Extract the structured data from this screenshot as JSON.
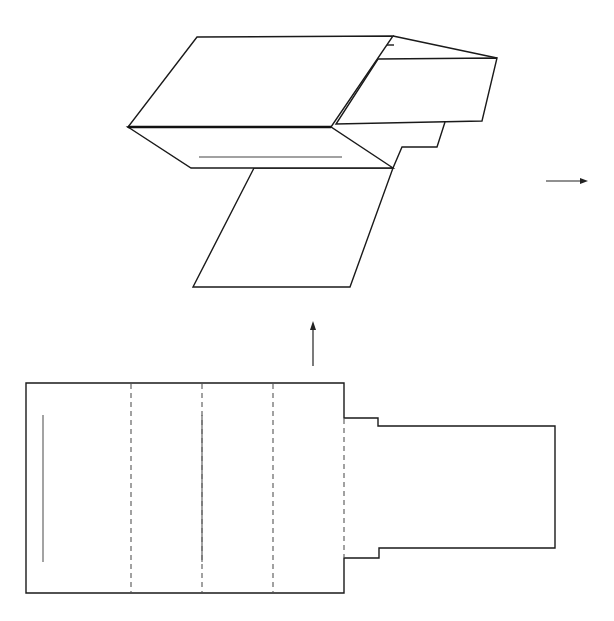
{
  "figure": {
    "colors": {
      "stroke": "#1a1a1a",
      "fold_line": "#555555",
      "background": "#ffffff"
    },
    "folded_shape": {
      "label": "folded 3D shape",
      "parts": [
        "top-panel",
        "front-panel",
        "front-slot-line",
        "side-tab-box",
        "step-tab",
        "bottom-flap"
      ]
    },
    "flat_net": {
      "label": "flat net",
      "panels": 4,
      "fold_lines": 4,
      "cut_lines": 2,
      "tab": "side tab with stepped shoulders"
    },
    "arrows": [
      {
        "name": "up-arrow",
        "direction": "up",
        "meaning": "net folds into shape"
      },
      {
        "name": "right-arrow",
        "direction": "right",
        "meaning": "continue to next step"
      }
    ]
  }
}
